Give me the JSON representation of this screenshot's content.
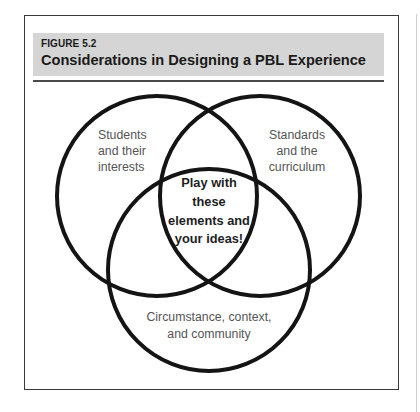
{
  "figure": {
    "label": "FIGURE 5.2",
    "title": "Considerations in Designing a PBL Experience"
  },
  "venn": {
    "circles": [
      {
        "name": "students",
        "lines": [
          "Students",
          "and their",
          "interests"
        ]
      },
      {
        "name": "standards",
        "lines": [
          "Standards",
          "and the",
          "curriculum"
        ]
      },
      {
        "name": "circumstance",
        "lines": [
          "Circumstance, context,",
          "and community"
        ]
      }
    ],
    "center": {
      "lines": [
        "Play with",
        "these",
        "elements and",
        "your ideas!"
      ]
    }
  },
  "colors": {
    "header_bg": "#d5d5d5",
    "stroke": "#141414",
    "label_text": "#555555",
    "center_text": "#1e1e1e"
  }
}
